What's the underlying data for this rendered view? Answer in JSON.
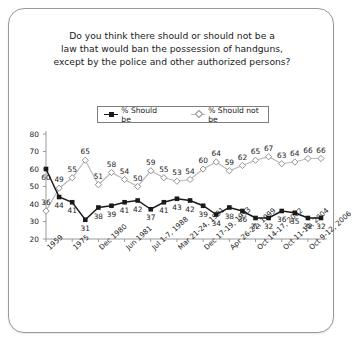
{
  "card": {
    "title_lines": [
      "Do you think there should or should not be a",
      "law that would ban the possession of handguns,",
      "except by the police and other authorized persons?"
    ]
  },
  "chart_data": {
    "type": "line",
    "title": "Do you think there should or should not be a law that would ban the possession of handguns, except by the police and other authorized persons?",
    "xlabel": "",
    "ylabel": "",
    "ylim": [
      20,
      80
    ],
    "yticks": [
      20,
      30,
      40,
      50,
      60,
      70,
      80
    ],
    "grid": false,
    "legend_position": "top-center",
    "n_points": 22,
    "tick_labels": [
      "1959",
      "1975",
      "Dec 1980",
      "Jun 1981",
      "Jul 1-7, 1988",
      "Mar 21-24, 1991",
      "Dec 17-19, 1993",
      "Apr 26-27, 1999",
      "Oct 14-17, 2002",
      "Oct 11-14, 2004",
      "Oct 9-12, 2006"
    ],
    "tick_indices": [
      0,
      2,
      4,
      6,
      8,
      10,
      12,
      14,
      16,
      18,
      20
    ],
    "series": [
      {
        "name": "% Should be",
        "marker": "filled-square",
        "color": "#1a1a1a",
        "values": [
          60,
          44,
          41,
          31,
          38,
          39,
          41,
          42,
          37,
          41,
          43,
          42,
          39,
          34,
          38,
          36,
          32,
          32,
          36,
          35,
          32,
          32
        ]
      },
      {
        "name": "% Should not be",
        "marker": "open-diamond",
        "color": "#b9b9b9",
        "values": [
          36,
          49,
          55,
          65,
          51,
          58,
          54,
          50,
          59,
          55,
          53,
          54,
          60,
          64,
          59,
          62,
          65,
          67,
          63,
          64,
          66,
          66
        ]
      }
    ]
  },
  "legend": {
    "items": [
      {
        "label": "% Should be"
      },
      {
        "label": "% Should not be"
      }
    ]
  }
}
